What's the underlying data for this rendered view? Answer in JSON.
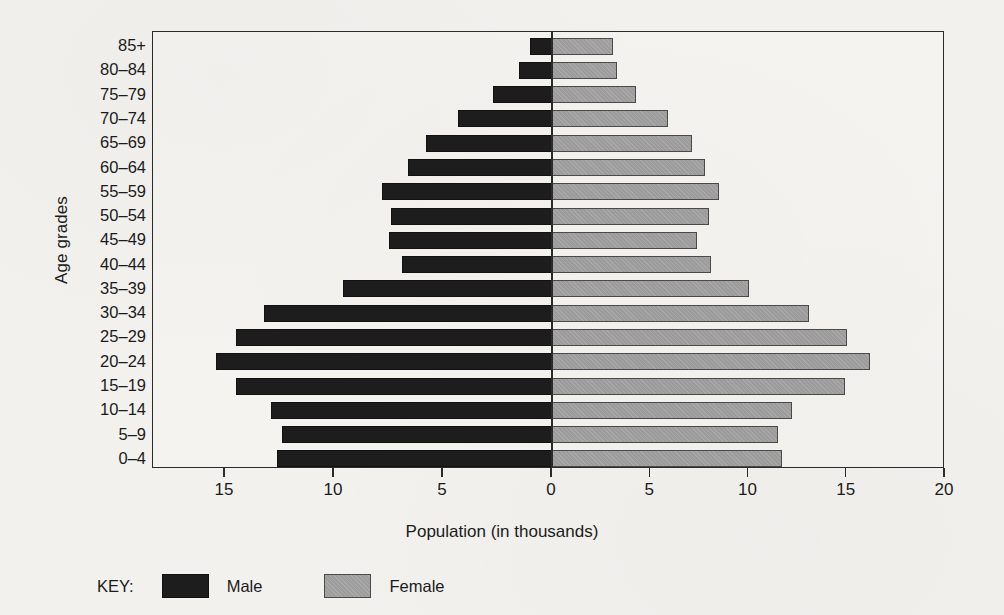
{
  "chart_data": {
    "type": "bar",
    "subtype": "population-pyramid",
    "title": "",
    "xlabel": "Population (in thousands)",
    "ylabel": "Age grades",
    "grid": false,
    "legend_position": "bottom-left",
    "legend_title": "KEY:",
    "xlim": [
      -18.5,
      20
    ],
    "x_ticks": [
      {
        "label": "15",
        "value": -15
      },
      {
        "label": "10",
        "value": -10
      },
      {
        "label": "5",
        "value": -5
      },
      {
        "label": "0",
        "value": 0
      },
      {
        "label": "5",
        "value": 5
      },
      {
        "label": "10",
        "value": 10
      },
      {
        "label": "15",
        "value": 15
      },
      {
        "label": "20",
        "value": 20
      }
    ],
    "categories": [
      "85+",
      "80–84",
      "75–79",
      "70–74",
      "65–69",
      "60–64",
      "55–59",
      "50–54",
      "45–49",
      "40–44",
      "35–39",
      "30–34",
      "25–29",
      "20–24",
      "15–19",
      "10–14",
      "5–9",
      "0–4"
    ],
    "series": [
      {
        "name": "Male",
        "color": "#1d1d1d",
        "side": "left",
        "values": [
          1.0,
          1.5,
          2.7,
          4.3,
          5.8,
          6.6,
          7.8,
          7.4,
          7.5,
          6.9,
          9.6,
          13.2,
          14.5,
          15.4,
          14.5,
          12.9,
          12.4,
          12.6
        ]
      },
      {
        "name": "Female",
        "color": "#9d9d9d",
        "side": "right",
        "values": [
          3.1,
          3.3,
          4.3,
          5.9,
          7.1,
          7.8,
          8.5,
          8.0,
          7.4,
          8.1,
          10.0,
          13.1,
          15.0,
          16.2,
          14.9,
          12.2,
          11.5,
          11.7
        ]
      }
    ]
  },
  "legend": {
    "title": "KEY:",
    "entries": [
      {
        "label": "Male",
        "swatch": "male"
      },
      {
        "label": "Female",
        "swatch": "female"
      }
    ]
  },
  "axes": {
    "x_title": "Population (in thousands)",
    "y_title": "Age grades"
  }
}
